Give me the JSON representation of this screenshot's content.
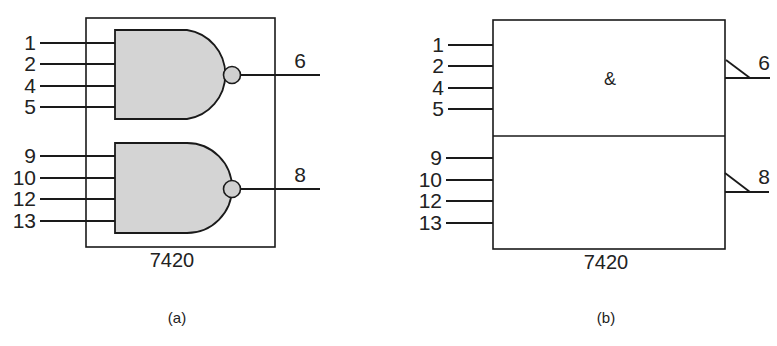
{
  "figure": {
    "colors": {
      "stroke": "#1a1a1a",
      "gate_fill": "#d4d4d4",
      "bubble_fill": "#d0d0d0",
      "background": "#ffffff"
    },
    "panel_a": {
      "caption": "(a)",
      "chip_label": "7420",
      "style": "distinctive-shape NAND gates",
      "gates": [
        {
          "name": "gate-1",
          "inputs": [
            "1",
            "2",
            "4",
            "5"
          ],
          "output": "6"
        },
        {
          "name": "gate-2",
          "inputs": [
            "9",
            "10",
            "12",
            "13"
          ],
          "output": "8"
        }
      ]
    },
    "panel_b": {
      "caption": "(b)",
      "chip_label": "7420",
      "style": "IEEE rectangular-shape symbol",
      "function_symbol": "&",
      "sections": [
        {
          "name": "section-1",
          "inputs": [
            "1",
            "2",
            "4",
            "5"
          ],
          "output": "6",
          "output_indicator": "negation-polarity"
        },
        {
          "name": "section-2",
          "inputs": [
            "9",
            "10",
            "12",
            "13"
          ],
          "output": "8",
          "output_indicator": "negation-polarity"
        }
      ]
    }
  }
}
